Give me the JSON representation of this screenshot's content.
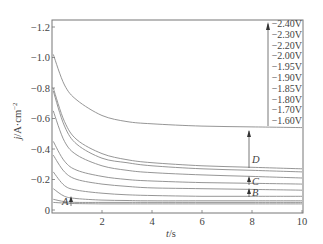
{
  "chart_data": {
    "type": "line",
    "title": "",
    "xlabel": "t/s",
    "ylabel": "j/A·cm⁻²",
    "xlim": [
      0,
      10
    ],
    "ylim": [
      0,
      -1.25
    ],
    "x_ticks": [
      "2",
      "4",
      "6",
      "8",
      "10"
    ],
    "y_ticks": [
      "-1.2",
      "-1.0",
      "-0.8",
      "-0.6",
      "-0.4",
      "-0.2",
      "0"
    ],
    "grid": false,
    "legend_position": "upper right",
    "legend": [
      "-2.40V",
      "-2.30V",
      "-2.20V",
      "-2.00V",
      "-1.95V",
      "-1.90V",
      "-1.85V",
      "-1.80V",
      "-1.70V",
      "-1.60V"
    ],
    "annotations": [
      "A",
      "B",
      "C",
      "D"
    ],
    "x": [
      0.05,
      0.5,
      1,
      2,
      3,
      4,
      6,
      8,
      10
    ],
    "series": [
      {
        "name": "-2.40V",
        "values": [
          -1.02,
          -0.82,
          -0.72,
          -0.62,
          -0.58,
          -0.565,
          -0.55,
          -0.545,
          -0.54
        ]
      },
      {
        "name": "-2.30V",
        "values": [
          -0.8,
          -0.58,
          -0.46,
          -0.37,
          -0.33,
          -0.31,
          -0.29,
          -0.28,
          -0.27
        ]
      },
      {
        "name": "-2.20V",
        "values": [
          -0.78,
          -0.55,
          -0.43,
          -0.34,
          -0.31,
          -0.29,
          -0.27,
          -0.26,
          -0.25
        ]
      },
      {
        "name": "-2.00V",
        "values": [
          -0.65,
          -0.45,
          -0.36,
          -0.29,
          -0.26,
          -0.245,
          -0.23,
          -0.22,
          -0.21
        ]
      },
      {
        "name": "-1.95V",
        "values": [
          -0.45,
          -0.32,
          -0.26,
          -0.22,
          -0.2,
          -0.19,
          -0.18,
          -0.175,
          -0.17
        ]
      },
      {
        "name": "-1.90V",
        "values": [
          -0.36,
          -0.25,
          -0.2,
          -0.17,
          -0.155,
          -0.145,
          -0.14,
          -0.135,
          -0.13
        ]
      },
      {
        "name": "-1.85V",
        "values": [
          -0.25,
          -0.16,
          -0.13,
          -0.11,
          -0.1,
          -0.095,
          -0.09,
          -0.09,
          -0.09
        ]
      },
      {
        "name": "-1.80V",
        "values": [
          -0.14,
          -0.09,
          -0.075,
          -0.065,
          -0.062,
          -0.06,
          -0.06,
          -0.06,
          -0.06
        ]
      },
      {
        "name": "-1.70V",
        "values": [
          -0.07,
          -0.055,
          -0.05,
          -0.05,
          -0.05,
          -0.05,
          -0.05,
          -0.05,
          -0.05
        ]
      },
      {
        "name": "-1.60V",
        "values": [
          -0.05,
          -0.045,
          -0.042,
          -0.04,
          -0.04,
          -0.04,
          -0.04,
          -0.04,
          -0.04
        ]
      }
    ]
  },
  "labels": {
    "ylabel_main": "j",
    "ylabel_unit": "/A·cm",
    "ylabel_exp": "−2",
    "xlabel_main": "t",
    "xlabel_unit": "/s"
  },
  "colors": {
    "axis": "#777777",
    "curve": "#8a8a8a",
    "text": "#444444"
  }
}
